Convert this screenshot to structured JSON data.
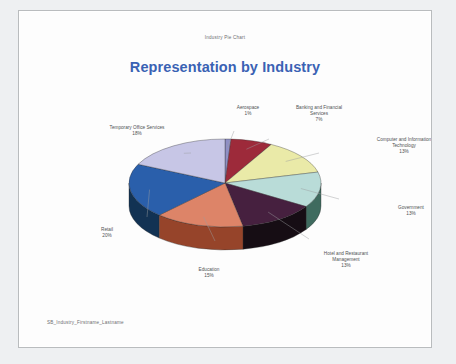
{
  "document": {
    "header_caption": "Industry Pie Chart",
    "footer_caption": "SB_Industry_Firstname_Lastname"
  },
  "chart_data": {
    "type": "pie",
    "title": "Representation by Industry",
    "subtitle": "",
    "xlabel": "",
    "ylabel": "",
    "legend_position": "none",
    "labels_position": "outside-with-leader-lines",
    "three_d": true,
    "total": 100,
    "units": "percent",
    "categories": [
      "Aerospace",
      "Banking and Financial Services",
      "Computer and Information Technology",
      "Government",
      "Hotel and Restaurant Management",
      "Education",
      "Retail",
      "Temporary Office Services"
    ],
    "values": [
      1,
      7,
      13,
      13,
      13,
      15,
      20,
      18
    ],
    "slices": [
      {
        "label": "Aerospace",
        "value": 1,
        "display": "1%",
        "color": "#8f8fc4",
        "side_color": "#6f6fa6",
        "label_line1": "Aerospace",
        "label_line2": "1%",
        "label_line3": ""
      },
      {
        "label": "Banking and Financial Services",
        "value": 7,
        "display": "7%",
        "color": "#9d2a3a",
        "side_color": "#7a1f2c",
        "label_line1": "Banking and Financial",
        "label_line2": "Services",
        "label_line3": "7%"
      },
      {
        "label": "Computer and Information Technology",
        "value": 13,
        "display": "13%",
        "color": "#eaeaa8",
        "side_color": "#c9c98c",
        "label_line1": "Computer and Information",
        "label_line2": "Technology",
        "label_line3": "13%"
      },
      {
        "label": "Government",
        "value": 13,
        "display": "13%",
        "color": "#b9dcd8",
        "side_color": "#3f6b5f",
        "label_line1": "Government",
        "label_line2": "13%",
        "label_line3": ""
      },
      {
        "label": "Hotel and Restaurant Management",
        "value": 13,
        "display": "13%",
        "color": "#46203f",
        "side_color": "#160d14",
        "label_line1": "Hotel and Restaurant",
        "label_line2": "Management",
        "label_line3": "13%"
      },
      {
        "label": "Education",
        "value": 15,
        "display": "15%",
        "color": "#dd8468",
        "side_color": "#96442a",
        "label_line1": "Education",
        "label_line2": "15%",
        "label_line3": ""
      },
      {
        "label": "Retail",
        "value": 20,
        "display": "20%",
        "color": "#2a5fab",
        "side_color": "#123253",
        "label_line1": "Retail",
        "label_line2": "20%",
        "label_line3": ""
      },
      {
        "label": "Temporary Office Services",
        "value": 18,
        "display": "18%",
        "color": "#c7c6e6",
        "side_color": "#9a99c0",
        "label_line1": "Temporary Office Services",
        "label_line2": "18%",
        "label_line3": ""
      }
    ],
    "colors": {
      "title": "#3a62b4",
      "label_text": "#4f5153",
      "page_background": "#fdfdfd",
      "canvas_background": "#eef0f2"
    }
  }
}
